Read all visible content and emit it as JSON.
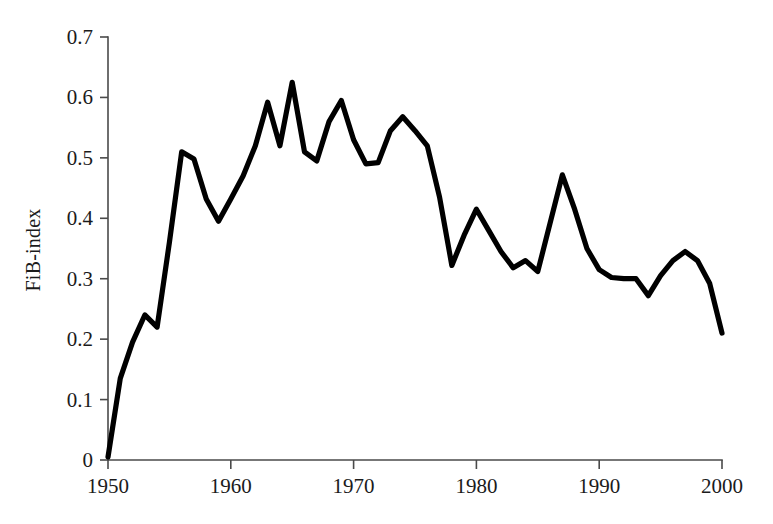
{
  "chart_data": {
    "type": "line",
    "title": "",
    "subtitle": "",
    "xlabel": "",
    "ylabel": "FiB-index",
    "xlim": [
      1950,
      2000
    ],
    "ylim": [
      0,
      0.7
    ],
    "grid": false,
    "legend": false,
    "legend_position": "none",
    "x_ticks": [
      1950,
      1960,
      1970,
      1980,
      1990,
      2000
    ],
    "x_tick_labels": [
      "1950",
      "1960",
      "1970",
      "1980",
      "1990",
      "2000"
    ],
    "y_ticks": [
      0,
      0.1,
      0.2,
      0.3,
      0.4,
      0.5,
      0.6,
      0.7
    ],
    "y_tick_labels": [
      "0",
      "0.1",
      "0.2",
      "0.3",
      "0.4",
      "0.5",
      "0.6",
      "0.7"
    ],
    "line_color": "#000000",
    "line_width": 5.2,
    "x": [
      1950,
      1951,
      1952,
      1953,
      1954,
      1955,
      1956,
      1957,
      1958,
      1959,
      1960,
      1961,
      1962,
      1963,
      1964,
      1965,
      1966,
      1967,
      1968,
      1969,
      1970,
      1971,
      1972,
      1973,
      1974,
      1975,
      1976,
      1977,
      1978,
      1979,
      1980,
      1981,
      1982,
      1983,
      1984,
      1985,
      1986,
      1987,
      1988,
      1989,
      1990,
      1991,
      1992,
      1993,
      1994,
      1995,
      1996,
      1997,
      1998,
      1999,
      2000
    ],
    "series": [
      {
        "name": "FiB-index",
        "values": [
          0.005,
          0.135,
          0.195,
          0.24,
          0.22,
          0.36,
          0.51,
          0.498,
          0.432,
          0.395,
          0.432,
          0.47,
          0.52,
          0.592,
          0.52,
          0.625,
          0.51,
          0.495,
          0.56,
          0.595,
          0.53,
          0.49,
          0.492,
          0.545,
          0.568,
          0.545,
          0.52,
          0.435,
          0.322,
          0.372,
          0.415,
          0.38,
          0.345,
          0.318,
          0.33,
          0.312,
          0.392,
          0.472,
          0.415,
          0.35,
          0.315,
          0.302,
          0.3,
          0.3,
          0.272,
          0.305,
          0.33,
          0.345,
          0.33,
          0.292,
          0.21
        ]
      }
    ],
    "annotations": []
  },
  "axes": {
    "y_axis_title": "FiB-index"
  }
}
